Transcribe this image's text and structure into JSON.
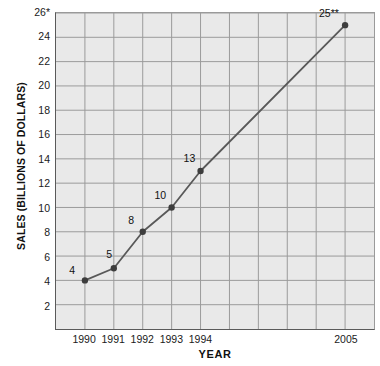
{
  "chart_data": {
    "type": "line",
    "title": "",
    "xlabel": "YEAR",
    "ylabel": "SALES (BILLIONS OF DOLLARS)",
    "categories": [
      "1990",
      "1991",
      "1992",
      "1993",
      "1994",
      "2005"
    ],
    "x_tick_labels": [
      "1990",
      "1991",
      "1992",
      "1993",
      "1994",
      "2005"
    ],
    "values": [
      4,
      5,
      8,
      10,
      13,
      25
    ],
    "point_labels": [
      "4",
      "5",
      "8",
      "10",
      "13",
      "25**"
    ],
    "y_tick_labels": [
      "2",
      "4",
      "6",
      "8",
      "10",
      "12",
      "14",
      "16",
      "18",
      "20",
      "22",
      "24",
      "26*"
    ],
    "y_ticks": [
      2,
      4,
      6,
      8,
      10,
      12,
      14,
      16,
      18,
      20,
      22,
      24,
      26
    ],
    "ylim": [
      0,
      26
    ],
    "xlim": [
      0,
      11
    ],
    "grid": true,
    "legend": "none",
    "marker": "circle",
    "colors": {
      "plot_background": "#e9e9e9",
      "gridline": "#f4f4f4",
      "gridline_major": "#9a9a9a",
      "axis": "#5a5a5a",
      "series_line": "#595959",
      "marker": "#3d3d3d",
      "text": "#111111",
      "page_background": "#ffffff"
    },
    "notes": {
      "top_tick_marker": "*",
      "last_point_marker": "**"
    }
  }
}
